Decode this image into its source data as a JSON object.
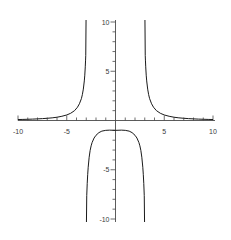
{
  "chart_data": {
    "type": "line",
    "title": "",
    "subtitle": "",
    "xlabel": "",
    "ylabel": "",
    "xlim": [
      -10,
      10
    ],
    "ylim": [
      -10,
      10
    ],
    "grid": false,
    "legend": false,
    "legend_position": "none",
    "function": "y = 9/(x^2 - 9)",
    "vertical_asymptotes": [
      -3,
      3
    ],
    "horizontal_asymptote": 0,
    "x_ticks_major": [
      -10,
      -5,
      5,
      10
    ],
    "x_tick_labels": [
      "-10",
      "-5",
      "5",
      "10"
    ],
    "x_ticks_minor": [
      -9,
      -8,
      -7,
      -6,
      -4,
      -3,
      -2,
      -1,
      1,
      2,
      3,
      4,
      6,
      7,
      8,
      9
    ],
    "y_ticks_major": [
      -10,
      -5,
      5,
      10
    ],
    "y_tick_labels": [
      "-10",
      "-5",
      "5",
      "10"
    ],
    "y_ticks_minor": [
      -9,
      -8,
      -7,
      -6,
      -4,
      -3,
      -2,
      -1,
      1,
      2,
      3,
      4,
      6,
      7,
      8,
      9
    ],
    "axis_color": "#4a4a4a",
    "curve_color": "#1a1a1a",
    "background_color": "#ffffff",
    "series": [
      {
        "name": "left-branch",
        "description": "x from -10 to -3, decreasing toward y=0 from above as x goes to -infinity, rising to +10 near x=-3",
        "x": [
          -10.0,
          -9.5,
          -9.0,
          -8.5,
          -8.0,
          -7.5,
          -7.0,
          -6.5,
          -6.0,
          -5.5,
          -5.0,
          -4.6,
          -4.2,
          -3.9,
          -3.7,
          -3.5,
          -3.4,
          -3.3,
          -3.2,
          -3.15,
          -3.1,
          -3.07,
          -3.05
        ],
        "y": [
          0.0989,
          0.1107,
          0.125,
          0.1425,
          0.1636,
          0.1905,
          0.225,
          0.2687,
          0.3333,
          0.4286,
          0.5625,
          0.7317,
          1.0,
          1.3483,
          1.6981,
          2.2154,
          2.6218,
          3.1868,
          4.0179,
          4.6017,
          5.4464,
          6.1288,
          6.6176
        ]
      },
      {
        "name": "middle-branch",
        "description": "between asymptotes, max -1 at x=0, diving to -10 near x=+/-3",
        "x": [
          -2.95,
          -2.9,
          -2.85,
          -2.8,
          -2.7,
          -2.6,
          -2.5,
          -2.4,
          -2.2,
          -2.0,
          -1.7,
          -1.4,
          -1.0,
          -0.6,
          0.0,
          0.6,
          1.0,
          1.4,
          1.7,
          2.0,
          2.2,
          2.4,
          2.5,
          2.6,
          2.7,
          2.8,
          2.85,
          2.9,
          2.95
        ],
        "y": [
          -7.6271,
          -6.3793,
          -5.4622,
          -4.7458,
          -3.7267,
          -3.0357,
          -2.5714,
          -2.2368,
          -1.7822,
          -1.5,
          -1.2303,
          -1.0772,
          -1.0,
          -0.9779,
          -1.0,
          -0.9779,
          -1.0,
          -1.0772,
          -1.2303,
          -1.5,
          -1.7822,
          -2.2368,
          -2.5714,
          -3.0357,
          -3.7267,
          -4.7458,
          -5.4622,
          -6.3793,
          -7.6271
        ]
      },
      {
        "name": "right-branch",
        "description": "x from 3 to 10, falling from +10 near x=3 toward y=0 from above",
        "x": [
          3.05,
          3.07,
          3.1,
          3.15,
          3.2,
          3.3,
          3.4,
          3.5,
          3.7,
          3.9,
          4.2,
          4.6,
          5.0,
          5.5,
          6.0,
          6.5,
          7.0,
          7.5,
          8.0,
          8.5,
          9.0,
          9.5,
          10.0
        ],
        "y": [
          6.6176,
          6.1288,
          5.4464,
          4.6017,
          4.0179,
          3.1868,
          2.6218,
          2.2154,
          1.6981,
          1.3483,
          1.0,
          0.7317,
          0.5625,
          0.4286,
          0.3333,
          0.2687,
          0.225,
          0.1905,
          0.1636,
          0.1425,
          0.125,
          0.1107,
          0.0989
        ]
      }
    ]
  },
  "axes": {
    "x_labels": [
      {
        "text": "-10",
        "value": -10
      },
      {
        "text": "-5",
        "value": -5
      },
      {
        "text": "5",
        "value": 5
      },
      {
        "text": "10",
        "value": 10
      }
    ],
    "y_labels": [
      {
        "text": "10",
        "value": 10
      },
      {
        "text": "5",
        "value": 5
      },
      {
        "text": "-5",
        "value": -5
      },
      {
        "text": "-10",
        "value": -10
      }
    ]
  }
}
